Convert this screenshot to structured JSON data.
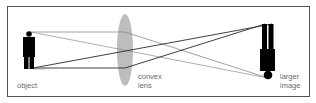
{
  "diagram": {
    "type": "convex-lens-ray-diagram",
    "labels": {
      "object": "object",
      "lens_line1": "convex",
      "lens_line2": "lens",
      "image_line1": "larger",
      "image_line2": "image"
    },
    "colors": {
      "frame": "#555555",
      "lens": "#bdbdbd",
      "figure": "#000000",
      "ray_thin": "#8a8a8a",
      "ray_dark": "#2a2a2a",
      "text": "#6a6a6a"
    }
  }
}
